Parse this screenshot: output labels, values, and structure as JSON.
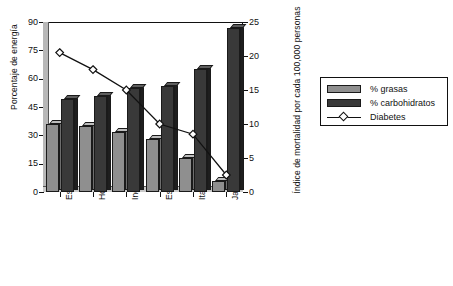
{
  "chart_data": {
    "type": "bar",
    "title": "",
    "subtitle": "",
    "categories": [
      "Estados Unidos",
      "Holanda",
      "Inglaterra y Gales",
      "Escocia",
      "Italia",
      "Japón"
    ],
    "series": [
      {
        "name": "% grasas",
        "type": "bar",
        "axis": "left",
        "values": [
          36,
          35,
          32,
          28,
          18,
          6
        ]
      },
      {
        "name": "% carbohidratos",
        "type": "bar",
        "axis": "left",
        "values": [
          49,
          51,
          55,
          56,
          65,
          87
        ]
      },
      {
        "name": "Diabetes",
        "type": "line",
        "axis": "right",
        "values": [
          20.5,
          18.0,
          15.0,
          10.0,
          8.5,
          2.5
        ]
      }
    ],
    "ylabel": "Porcentaje de energía",
    "ylabel_right": "Índice de mortalidad por cada 100,000 personas",
    "xlabel": "",
    "ylim": [
      0,
      90
    ],
    "ylim_right": [
      0,
      25
    ],
    "yticks": [
      0,
      15,
      30,
      45,
      60,
      75,
      90
    ],
    "yticks_right": [
      0,
      5,
      10,
      15,
      20,
      25
    ],
    "ytick_labels": [
      "0",
      "15",
      "30",
      "45",
      "60",
      "75",
      "90"
    ],
    "ytick_labels_right": [
      "0",
      "5",
      "10",
      "15",
      "20",
      "25"
    ],
    "grid": false,
    "legend_position": "right",
    "colors": {
      "grasas": "#8f8f8f",
      "carbohidratos": "#393939",
      "diabetes_line": "#111111",
      "diabetes_marker_fill": "#ffffff",
      "axis": "#111111",
      "background": "#ffffff"
    }
  },
  "legend": {
    "entries": [
      {
        "label": "% grasas",
        "marker": "square-swatch-gray"
      },
      {
        "label": "% carbohidratos",
        "marker": "square-swatch-dark"
      },
      {
        "label": "Diabetes",
        "marker": "line-diamond-marker"
      }
    ]
  }
}
